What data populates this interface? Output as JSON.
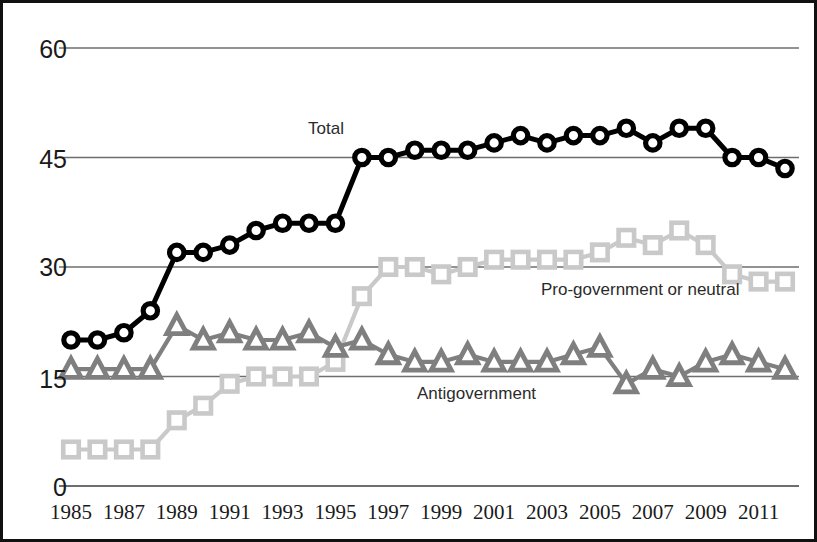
{
  "chart_data": {
    "type": "line",
    "title": "",
    "subtitle": "",
    "xlabel": "",
    "ylabel": "",
    "grid": true,
    "legend_position": "inline-annotations",
    "xlim": [
      1985,
      2012
    ],
    "ylim": [
      0,
      60
    ],
    "y_ticks": [
      0,
      15,
      30,
      45,
      60
    ],
    "x_ticks": [
      1985,
      1987,
      1989,
      1991,
      1993,
      1995,
      1997,
      1999,
      2001,
      2003,
      2005,
      2007,
      2009,
      2011
    ],
    "x": [
      1985,
      1986,
      1987,
      1988,
      1989,
      1990,
      1991,
      1992,
      1993,
      1994,
      1995,
      1996,
      1997,
      1998,
      1999,
      2000,
      2001,
      2002,
      2003,
      2004,
      2005,
      2006,
      2007,
      2008,
      2009,
      2010,
      2011,
      2012
    ],
    "series": [
      {
        "name": "Total",
        "marker": "circle",
        "color": "#000000",
        "label_text": "Total",
        "values": [
          20,
          20,
          21,
          24,
          32,
          32,
          33,
          35,
          36,
          36,
          36,
          45,
          45,
          46,
          46,
          46,
          47,
          48,
          47,
          48,
          48,
          49,
          47,
          49,
          49,
          45,
          45,
          43.5
        ]
      },
      {
        "name": "Pro-government or neutral",
        "marker": "square",
        "color": "#c9c9c9",
        "label_text": "Pro-government or neutral",
        "values": [
          5,
          5,
          5,
          5,
          9,
          11,
          14,
          15,
          15,
          15,
          17,
          26,
          30,
          30,
          29,
          30,
          31,
          31,
          31,
          31,
          32,
          34,
          33,
          35,
          33,
          29,
          28,
          28
        ]
      },
      {
        "name": "Antigovernment",
        "marker": "triangle",
        "color": "#7f7f7f",
        "label_text": "Antigovernment",
        "values": [
          16,
          16,
          16,
          16,
          22,
          20,
          21,
          20,
          20,
          21,
          19,
          20,
          18,
          17,
          17,
          18,
          17,
          17,
          17,
          18,
          19,
          14,
          16,
          15,
          17,
          18,
          17,
          16
        ]
      }
    ]
  },
  "axis": {
    "y_tick_labels": [
      "60",
      "45",
      "30",
      "15",
      "0"
    ],
    "x_tick_labels": [
      "1985",
      "1987",
      "1989",
      "1991",
      "1993",
      "1995",
      "1997",
      "1999",
      "2001",
      "2003",
      "2005",
      "2007",
      "2009",
      "2011"
    ]
  },
  "annotations": {
    "total": "Total",
    "progov": "Pro-government or neutral",
    "antigov": "Antigovernment"
  },
  "colors": {
    "total": "#000000",
    "progov": "#c9c9c9",
    "antigov": "#7f7f7f",
    "gridline": "#6e6e6e",
    "frame": "#111111",
    "text": "#1a1a1a"
  }
}
